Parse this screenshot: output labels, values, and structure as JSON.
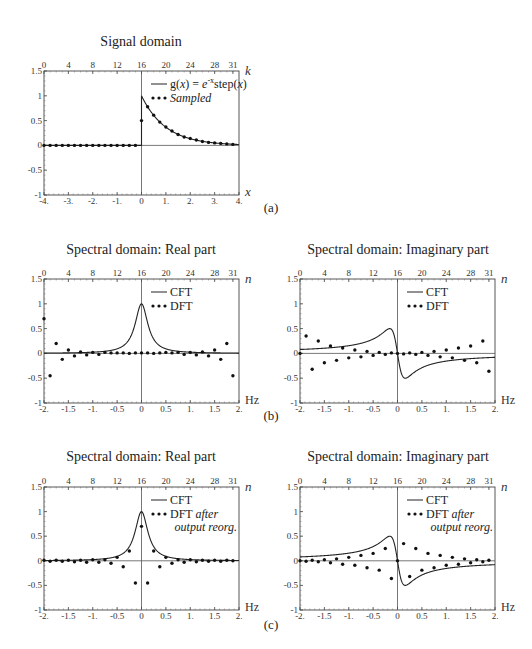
{
  "figure": {
    "panel_labels": [
      "(a)",
      "(b)",
      "(c)"
    ]
  },
  "chart_data": [
    {
      "id": "a",
      "type": "line",
      "title": "Signal domain",
      "xlabel": "x",
      "top_axis_label": "k",
      "xlim": [
        -4,
        4
      ],
      "ylim": [
        -1,
        1.5
      ],
      "xticks": [
        "-4.",
        "-3.",
        "-2.",
        "-1.",
        "0",
        "1.",
        "2.",
        "3.",
        "4."
      ],
      "top_ticks": [
        "0",
        "4",
        "8",
        "12",
        "16",
        "20",
        "24",
        "28",
        "31"
      ],
      "yticks": [
        "1.5",
        "1",
        "0.5",
        "0",
        "-0.5",
        "-1"
      ],
      "legend": [
        {
          "label": "g(x) = e^-x step(x)",
          "style": "line"
        },
        {
          "label": "Sampled",
          "style": "dots"
        }
      ],
      "series": [
        {
          "name": "g(x) = e^-x step(x)",
          "function": "exp(-x) for x>=0, 0 for x<0"
        },
        {
          "name": "Sampled",
          "x": [
            -4,
            -3.75,
            -3.5,
            -3.25,
            -3,
            -2.75,
            -2.5,
            -2.25,
            -2,
            -1.75,
            -1.5,
            -1.25,
            -1,
            -0.75,
            -0.5,
            -0.25,
            0,
            0.25,
            0.5,
            0.75,
            1,
            1.25,
            1.5,
            1.75,
            2,
            2.25,
            2.5,
            2.75,
            3,
            3.25,
            3.5,
            3.75
          ],
          "values": [
            0,
            0,
            0,
            0,
            0,
            0,
            0,
            0,
            0,
            0,
            0,
            0,
            0,
            0,
            0,
            0,
            0.5,
            0.78,
            0.61,
            0.47,
            0.37,
            0.29,
            0.22,
            0.17,
            0.14,
            0.11,
            0.08,
            0.06,
            0.05,
            0.04,
            0.03,
            0.02
          ]
        }
      ]
    },
    {
      "id": "b-real",
      "type": "line",
      "title": "Spectral domain: Real part",
      "xlabel": "Hz",
      "top_axis_label": "n",
      "xlim": [
        -2,
        2
      ],
      "ylim": [
        -1,
        1.5
      ],
      "xticks": [
        "-2.",
        "-1.5",
        "-1.",
        "-0.5",
        "0",
        "0.5",
        "1.",
        "1.5",
        "2."
      ],
      "top_ticks": [
        "0",
        "4",
        "8",
        "12",
        "16",
        "20",
        "24",
        "28",
        "31"
      ],
      "yticks": [
        "1.5",
        "1",
        "0.5",
        "0",
        "-0.5",
        "-1"
      ],
      "legend": [
        {
          "label": "CFT",
          "style": "line"
        },
        {
          "label": "DFT",
          "style": "dots"
        }
      ],
      "series": [
        {
          "name": "CFT",
          "function": "1/(1+(2*pi*f)^2)"
        },
        {
          "name": "DFT",
          "values": [
            0.7,
            -0.45,
            0.2,
            -0.12,
            0.07,
            -0.05,
            0.03,
            -0.03,
            0.02,
            -0.02,
            0.02,
            0.01,
            0.01,
            0.01,
            0.0,
            0.01,
            0.01,
            0.01,
            0.0,
            0.01,
            0.02,
            0.01,
            0.02,
            -0.02,
            0.02,
            -0.03,
            0.03,
            -0.05,
            0.07,
            -0.12,
            0.2,
            -0.45
          ]
        }
      ]
    },
    {
      "id": "b-imag",
      "type": "line",
      "title": "Spectral domain: Imaginary part",
      "xlabel": "Hz",
      "top_axis_label": "n",
      "xlim": [
        -2,
        2
      ],
      "ylim": [
        -1,
        1.5
      ],
      "xticks": [
        "-2.",
        "-1.5",
        "-1.",
        "-0.5",
        "0",
        "0.5",
        "1.",
        "1.5",
        "2."
      ],
      "top_ticks": [
        "0",
        "4",
        "8",
        "12",
        "16",
        "20",
        "24",
        "28",
        "31"
      ],
      "yticks": [
        "1.5",
        "1",
        "0.5",
        "0",
        "-0.5",
        "-1"
      ],
      "legend": [
        {
          "label": "CFT",
          "style": "line"
        },
        {
          "label": "DFT",
          "style": "dots"
        }
      ],
      "series": [
        {
          "name": "CFT",
          "function": "-2*pi*f/(1+(2*pi*f)^2)"
        },
        {
          "name": "DFT",
          "values": [
            0.0,
            0.35,
            -0.32,
            0.25,
            -0.19,
            0.15,
            -0.14,
            0.11,
            -0.09,
            0.07,
            -0.07,
            0.04,
            -0.04,
            0.02,
            -0.02,
            0.01,
            0.0,
            -0.01,
            0.01,
            -0.02,
            0.02,
            -0.04,
            0.04,
            -0.07,
            0.07,
            -0.09,
            0.11,
            -0.14,
            0.15,
            -0.19,
            0.25,
            -0.36
          ]
        }
      ]
    },
    {
      "id": "c-real",
      "type": "line",
      "title": "Spectral domain: Real part",
      "xlabel": "Hz",
      "top_axis_label": "n",
      "xlim": [
        -2,
        2
      ],
      "ylim": [
        -1,
        1.5
      ],
      "xticks": [
        "-2.",
        "-1.5",
        "-1.",
        "-0.5",
        "0",
        "0.5",
        "1.",
        "1.5",
        "2."
      ],
      "top_ticks": [
        "0",
        "4",
        "8",
        "12",
        "16",
        "20",
        "24",
        "28",
        "31"
      ],
      "yticks": [
        "1.5",
        "1",
        "0.5",
        "0",
        "-0.5",
        "-1"
      ],
      "legend": [
        {
          "label": "CFT",
          "style": "line"
        },
        {
          "label": "DFT after output reorg.",
          "style": "dots"
        }
      ],
      "series": [
        {
          "name": "CFT",
          "function": "1/(1+(2*pi*f)^2)"
        },
        {
          "name": "DFT after output reorg.",
          "values": [
            0.01,
            -0.01,
            0.01,
            -0.01,
            0.01,
            -0.02,
            0.01,
            -0.03,
            0.02,
            -0.03,
            0.02,
            -0.05,
            0.07,
            -0.12,
            0.2,
            -0.45,
            0.7,
            -0.45,
            0.2,
            -0.12,
            0.07,
            -0.05,
            0.02,
            -0.03,
            0.02,
            -0.02,
            0.01,
            -0.01,
            0.01,
            -0.01,
            0.01,
            0.0
          ]
        }
      ]
    },
    {
      "id": "c-imag",
      "type": "line",
      "title": "Spectral domain: Imaginary part",
      "xlabel": "Hz",
      "top_axis_label": "n",
      "xlim": [
        -2,
        2
      ],
      "ylim": [
        -1,
        1.5
      ],
      "xticks": [
        "-2.",
        "-1.5",
        "-1.",
        "-0.5",
        "0",
        "0.5",
        "1.",
        "1.5",
        "2."
      ],
      "top_ticks": [
        "0",
        "4",
        "8",
        "12",
        "16",
        "20",
        "24",
        "28",
        "31"
      ],
      "yticks": [
        "1.5",
        "1",
        "0.5",
        "0",
        "-0.5",
        "-1"
      ],
      "legend": [
        {
          "label": "CFT",
          "style": "line"
        },
        {
          "label": "DFT after output reorg.",
          "style": "dots"
        }
      ],
      "series": [
        {
          "name": "CFT",
          "function": "-2*pi*f/(1+(2*pi*f)^2)"
        },
        {
          "name": "DFT after output reorg.",
          "values": [
            0.0,
            -0.01,
            0.01,
            -0.02,
            0.02,
            -0.04,
            0.04,
            -0.07,
            0.07,
            -0.09,
            0.11,
            -0.14,
            0.15,
            -0.19,
            0.25,
            -0.36,
            0.0,
            0.35,
            -0.32,
            0.25,
            -0.19,
            0.15,
            -0.14,
            0.11,
            -0.09,
            0.07,
            -0.07,
            0.04,
            -0.04,
            0.02,
            -0.02,
            0.01
          ]
        }
      ]
    }
  ]
}
